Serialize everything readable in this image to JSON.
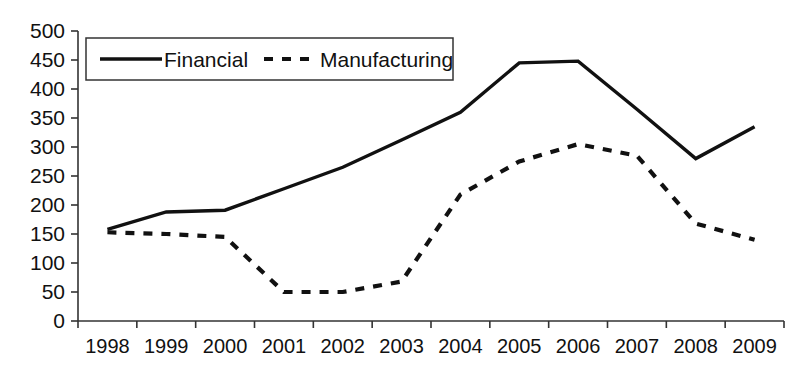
{
  "chart_data": {
    "type": "line",
    "title": "",
    "xlabel": "",
    "ylabel": "",
    "categories": [
      "1998",
      "1999",
      "2000",
      "2001",
      "2002",
      "2003",
      "2004",
      "2005",
      "2006",
      "2007",
      "2008",
      "2009"
    ],
    "series": [
      {
        "name": "Financial",
        "style": "solid",
        "color": "#111111",
        "values": [
          158,
          188,
          191,
          228,
          265,
          312,
          360,
          445,
          448,
          365,
          280,
          335
        ]
      },
      {
        "name": "Manufacturing",
        "style": "dashed",
        "color": "#111111",
        "values": [
          153,
          150,
          145,
          50,
          50,
          68,
          218,
          275,
          305,
          285,
          168,
          140
        ]
      }
    ],
    "ylim": [
      0,
      500
    ],
    "ytick_step": 50,
    "yticks": [
      "0",
      "50",
      "100",
      "150",
      "200",
      "250",
      "300",
      "350",
      "400",
      "450",
      "500"
    ],
    "grid": false,
    "legend": {
      "position": "top-left-inside",
      "entries": [
        {
          "label": "Financial",
          "style": "solid"
        },
        {
          "label": "Manufacturing",
          "style": "dashed"
        }
      ]
    }
  }
}
